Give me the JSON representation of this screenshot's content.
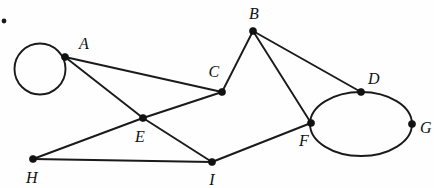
{
  "figure": {
    "kind": "undirected-graph-drawing",
    "width": 434,
    "height": 188,
    "background_color": "#fefefe",
    "stroke_color": "#1a1a1a",
    "vertex_fill_color": "#111111",
    "edge_width": 1.9,
    "vertex_radius": 3.6
  },
  "vertices": [
    {
      "id": "A",
      "label": "A",
      "x": 65,
      "y": 57,
      "label_x": 84,
      "label_y": 44
    },
    {
      "id": "B",
      "label": "B",
      "x": 253,
      "y": 31,
      "label_x": 254,
      "label_y": 14
    },
    {
      "id": "C",
      "label": "C",
      "x": 222,
      "y": 92,
      "label_x": 214,
      "label_y": 72
    },
    {
      "id": "D",
      "label": "D",
      "x": 361,
      "y": 92,
      "label_x": 374,
      "label_y": 79
    },
    {
      "id": "E",
      "label": "E",
      "x": 143,
      "y": 118,
      "label_x": 140,
      "label_y": 137
    },
    {
      "id": "F",
      "label": "F",
      "x": 311,
      "y": 123,
      "label_x": 304,
      "label_y": 141
    },
    {
      "id": "G",
      "label": "G",
      "x": 412,
      "y": 124,
      "label_x": 426,
      "label_y": 128
    },
    {
      "id": "H",
      "label": "H",
      "x": 33,
      "y": 159,
      "label_x": 32,
      "label_y": 178
    },
    {
      "id": "I",
      "label": "I",
      "x": 212,
      "y": 162,
      "label_x": 212,
      "label_y": 180
    }
  ],
  "edges": [
    {
      "from": "A",
      "to": "C"
    },
    {
      "from": "A",
      "to": "E"
    },
    {
      "from": "E",
      "to": "I"
    },
    {
      "from": "H",
      "to": "E"
    },
    {
      "from": "E",
      "to": "C"
    },
    {
      "from": "H",
      "to": "I"
    },
    {
      "from": "I",
      "to": "F"
    },
    {
      "from": "B",
      "to": "C"
    },
    {
      "from": "B",
      "to": "F"
    },
    {
      "from": "B",
      "to": "D"
    }
  ],
  "loops": [
    {
      "id": "loop-at-A",
      "at": "A",
      "shape": "circle",
      "cx": 40,
      "cy": 69,
      "r": 25.5
    }
  ],
  "cycles": [
    {
      "id": "oval-F-D-G",
      "shape": "ellipse",
      "through": [
        "F",
        "D",
        "G"
      ],
      "cx": 361,
      "cy": 124,
      "rx": 51,
      "ry": 32
    }
  ],
  "artifacts": [
    {
      "id": "scan-speck",
      "x": 4,
      "y": 21,
      "r": 2.4
    }
  ]
}
